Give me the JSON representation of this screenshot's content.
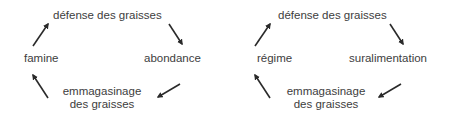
{
  "diagram": {
    "type": "cycle-pair",
    "arrow_color": "#2a2a2a",
    "text_color": "#3d3d3d",
    "cycles": [
      {
        "name": "natural-cycle",
        "nodes": {
          "top": "défense des graisses",
          "right": "abondance",
          "bottom_line1": "emmagasinage",
          "bottom_line2": "des graisses",
          "left": "famine"
        },
        "flow": [
          "défense des graisses",
          "abondance",
          "emmagasinage des graisses",
          "famine",
          "défense des graisses"
        ]
      },
      {
        "name": "diet-cycle",
        "nodes": {
          "top": "défense des graisses",
          "right": "suralimentation",
          "bottom_line1": "emmagasinage",
          "bottom_line2": "des graisses",
          "left": "régime"
        },
        "flow": [
          "défense des graisses",
          "suralimentation",
          "emmagasinage des graisses",
          "régime",
          "défense des graisses"
        ]
      }
    ]
  }
}
